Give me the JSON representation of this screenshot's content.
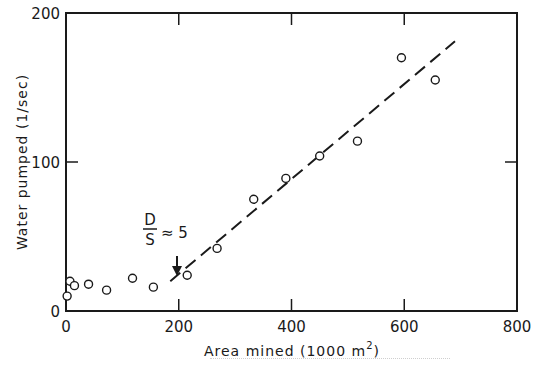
{
  "chart_data": {
    "type": "scatter",
    "title": "",
    "xlabel": "Area mined (1000 m²)",
    "xlabel_main": "Area mined (1000 m",
    "xlabel_sup": "2",
    "xlabel_end": ")",
    "ylabel": "Water pumped (1/sec)",
    "xlim": [
      0,
      800
    ],
    "ylim": [
      0,
      200
    ],
    "xticks": [
      0,
      200,
      400,
      600,
      800
    ],
    "yticks": [
      0,
      100,
      200
    ],
    "xtick_labels": [
      "0",
      "200",
      "400",
      "600",
      "800"
    ],
    "ytick_labels": [
      "0",
      "100",
      "200"
    ],
    "grid": false,
    "legend": null,
    "series": [
      {
        "name": "observations",
        "marker": "open-circle",
        "points": [
          {
            "x": 2,
            "y": 10
          },
          {
            "x": 7,
            "y": 20
          },
          {
            "x": 15,
            "y": 17
          },
          {
            "x": 40,
            "y": 18
          },
          {
            "x": 72,
            "y": 14
          },
          {
            "x": 118,
            "y": 22
          },
          {
            "x": 155,
            "y": 16
          },
          {
            "x": 215,
            "y": 24
          },
          {
            "x": 268,
            "y": 42
          },
          {
            "x": 333,
            "y": 75
          },
          {
            "x": 390,
            "y": 89
          },
          {
            "x": 450,
            "y": 104
          },
          {
            "x": 517,
            "y": 114
          },
          {
            "x": 595,
            "y": 170
          },
          {
            "x": 655,
            "y": 155
          }
        ]
      },
      {
        "name": "trend",
        "style": "dashed-line",
        "points": [
          {
            "x": 185,
            "y": 20
          },
          {
            "x": 690,
            "y": 181
          }
        ]
      }
    ],
    "annotations": [
      {
        "text_numerator": "D",
        "text_denominator": "S",
        "text_rest": "≈ 5",
        "x": 200,
        "arrow_to_y": 28,
        "meaning": "D/S ≈ 5"
      }
    ]
  },
  "colors": {
    "ink": "#1a1a1a",
    "background": "#ffffff"
  }
}
